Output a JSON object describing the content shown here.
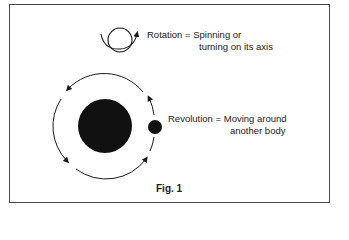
{
  "figure": {
    "caption": "Fig. 1",
    "colors": {
      "frame": "#4a4a4a",
      "ink": "#1a1a1a",
      "background": "#ffffff"
    }
  },
  "rotation": {
    "term": "Rotation",
    "line1": "Rotation = Spinning or",
    "line2": "turning on its axis",
    "icon": "rotating-sphere-icon"
  },
  "revolution": {
    "term": "Revolution",
    "line1": "Revolution = Moving around",
    "line2": "another body",
    "icons": [
      "planet-icon",
      "moon-icon",
      "orbit-arrows-icon"
    ]
  }
}
